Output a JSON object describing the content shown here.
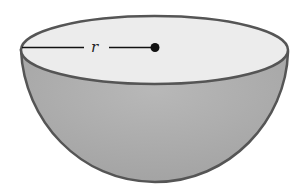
{
  "figure": {
    "type": "hemisphere",
    "label": "r",
    "label_meaning": "radius",
    "colors": {
      "background": "#ffffff",
      "top_face": "#ececec",
      "bowl": "#a9a9a9",
      "bowl_highlight": "#bdbdbd",
      "outline": "#555555",
      "radius_line": "#111111",
      "center_dot": "#111111"
    }
  }
}
